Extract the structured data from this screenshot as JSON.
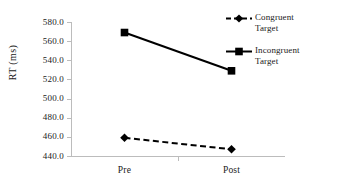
{
  "chart_data": {
    "type": "line",
    "title": "",
    "xlabel": "",
    "ylabel": "RT (ms)",
    "categories": [
      "Pre",
      "Post"
    ],
    "ylim": [
      440.0,
      580.0
    ],
    "yticks": [
      "440.0",
      "460.0",
      "480.0",
      "500.0",
      "520.0",
      "540.0",
      "560.0",
      "580.0"
    ],
    "ytick_values": [
      440,
      460,
      480,
      500,
      520,
      540,
      560,
      580
    ],
    "grid": false,
    "legend_position": "right",
    "series": [
      {
        "name": "Congruent Target",
        "legend_line1": "Congruent",
        "legend_line2": "Target",
        "values": [
          459,
          447
        ],
        "linestyle": "dashed",
        "marker": "diamond",
        "color": "#000000"
      },
      {
        "name": "Incongruent Target",
        "legend_line1": "Incongruent",
        "legend_line2": "Target",
        "values": [
          569,
          529
        ],
        "linestyle": "solid",
        "marker": "square",
        "color": "#000000"
      }
    ]
  },
  "style": {
    "axis_color": "#bcbcbc",
    "text_color": "#1a1a1a",
    "background": "#ffffff"
  }
}
